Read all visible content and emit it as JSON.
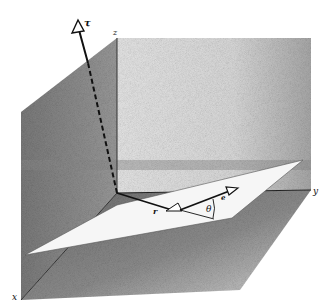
{
  "figure": {
    "axes": {
      "x_label": "x",
      "y_label": "y",
      "z_label": "z"
    },
    "vectors": {
      "tau_label": "τ",
      "r_label": "r",
      "e_label": "e"
    },
    "angle_label": "θ",
    "colors": {
      "background": "#ffffff",
      "left_wall": "#8a8a8a",
      "back_wall": "#d6d6d6",
      "floor": "#7c7c7c",
      "plane": "#f4f4f4",
      "ink": "#111111"
    }
  }
}
